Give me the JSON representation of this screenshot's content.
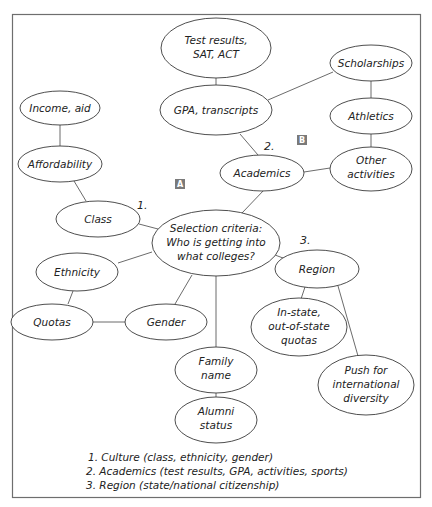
{
  "diagram": {
    "title": "Selection criteria: Who is getting into what colleges?",
    "nodes": {
      "center": {
        "lines": [
          "Selection criteria:",
          "Who is getting into",
          "what colleges?"
        ]
      },
      "test_results": {
        "lines": [
          "Test results,",
          "SAT, ACT"
        ]
      },
      "gpa": {
        "lines": [
          "GPA, transcripts"
        ]
      },
      "scholarships": {
        "lines": [
          "Scholarships"
        ]
      },
      "athletics": {
        "lines": [
          "Athletics"
        ]
      },
      "other_activities": {
        "lines": [
          "Other",
          "activities"
        ]
      },
      "academics": {
        "lines": [
          "Academics"
        ]
      },
      "income_aid": {
        "lines": [
          "Income, aid"
        ]
      },
      "affordability": {
        "lines": [
          "Affordability"
        ]
      },
      "class": {
        "lines": [
          "Class"
        ]
      },
      "ethnicity": {
        "lines": [
          "Ethnicity"
        ]
      },
      "quotas": {
        "lines": [
          "Quotas"
        ]
      },
      "gender": {
        "lines": [
          "Gender"
        ]
      },
      "region": {
        "lines": [
          "Region"
        ]
      },
      "in_state": {
        "lines": [
          "In-state,",
          "out-of-state",
          "quotas"
        ]
      },
      "push_international": {
        "lines": [
          "Push for",
          "international",
          "diversity"
        ]
      },
      "family_name": {
        "lines": [
          "Family",
          "name"
        ]
      },
      "alumni_status": {
        "lines": [
          "Alumni",
          "status"
        ]
      }
    },
    "branch_numbers": {
      "culture": "1.",
      "academics": "2.",
      "region": "3."
    },
    "badges": {
      "a": "A",
      "b": "B"
    },
    "legend": [
      "1. Culture (class, ethnicity, gender)",
      "2. Academics (test results, GPA, activities, sports)",
      "3. Region (state/national citizenship)"
    ],
    "colors": {
      "badge": "#7a7a7a",
      "frame": "#6e6e6e",
      "line": "#5a5a5a"
    }
  }
}
